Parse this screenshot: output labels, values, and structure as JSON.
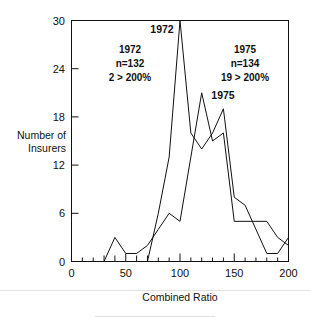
{
  "chart_data": {
    "type": "line",
    "title": "",
    "subtitle": "",
    "xlabel": "Combined Ratio",
    "ylabel": "Number of Insurers",
    "ylabel_line1": "Number of",
    "ylabel_line2": "Insurers",
    "xlim": [
      0,
      200
    ],
    "ylim": [
      0,
      30
    ],
    "xticks": [
      0,
      50,
      100,
      150,
      200
    ],
    "xtick_labels": [
      "0",
      "50",
      "100",
      "150",
      "200"
    ],
    "x_minor_ticks": [
      10,
      20,
      30,
      40,
      60,
      70,
      80,
      90,
      110,
      120,
      130,
      140,
      160,
      170,
      180,
      190
    ],
    "yticks": [
      0,
      6,
      12,
      18,
      24,
      30
    ],
    "ytick_labels": [
      "0",
      "6",
      "12",
      "18",
      "24",
      "30"
    ],
    "grid": false,
    "legend_position": "inline-annotations",
    "frame": true,
    "line_color": "#111111",
    "series": [
      {
        "name": "1972",
        "label": "1972",
        "x": [
          70,
          80,
          90,
          100,
          110,
          120,
          130,
          140,
          150,
          160,
          170,
          180,
          190,
          200
        ],
        "values": [
          0,
          6,
          13,
          30,
          16,
          14,
          16,
          19,
          8,
          7,
          4,
          1,
          1,
          3
        ]
      },
      {
        "name": "1975",
        "label": "1975",
        "x": [
          30,
          40,
          50,
          60,
          70,
          80,
          90,
          100,
          110,
          120,
          130,
          140,
          150,
          160,
          170,
          180,
          190,
          200
        ],
        "values": [
          0,
          3,
          1,
          1,
          2,
          4,
          6,
          5,
          13,
          21,
          15,
          16,
          5,
          5,
          5,
          5,
          3,
          2
        ]
      }
    ],
    "annotations": [
      {
        "id": "left",
        "line1": "1972",
        "line2": "n=132",
        "line3": "2  >  200%"
      },
      {
        "id": "right",
        "line1": "1975",
        "line2": "n=134",
        "line3": "19  >  200%"
      }
    ],
    "curve_labels": [
      {
        "id": "label-1972",
        "text": "1972"
      },
      {
        "id": "label-1975",
        "text": "1975"
      }
    ]
  }
}
